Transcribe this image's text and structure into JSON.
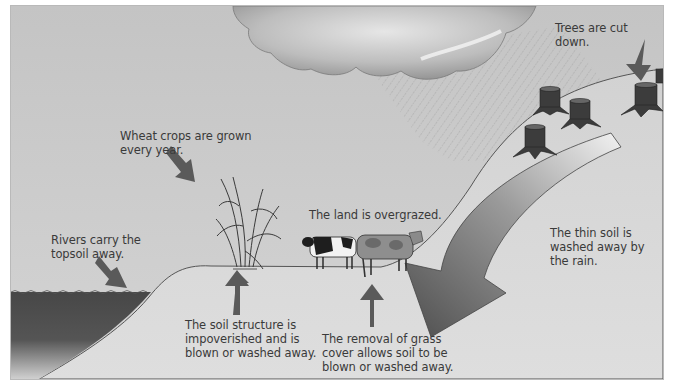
{
  "diagram": {
    "topic": "Soil erosion",
    "colors": {
      "sky": "#c9c9c9",
      "ground": "#d6d6d6",
      "water": "#4a4a4a",
      "arrow": "#5c5c5c",
      "text": "#3a3a3a",
      "outline": "#555555"
    },
    "labels": {
      "wheat": "Wheat crops are grown\nevery year.",
      "rivers": "Rivers carry the\ntopsoil away.",
      "overgrazed": "The land is overgrazed.",
      "trees": "Trees are cut down.",
      "thin_soil": "The thin soil is\nwashed away by\nthe rain.",
      "soil_structure": "The soil structure is\nimpoverished and is\nblown or washed away.",
      "grass_cover": "The removal of grass\ncover allows soil to be\nblown or washed away."
    },
    "elements": {
      "cloud": "rain-cloud-icon",
      "rain": "rain-streaks",
      "wheat": "wheat-plant-icon",
      "cows": [
        "cow-holstein-icon",
        "cow-brown-icon"
      ],
      "stumps": [
        "tree-stump-icon",
        "tree-stump-icon",
        "tree-stump-icon",
        "tree-stump-icon",
        "tree-stump-icon"
      ],
      "river": "river-water",
      "big_arrow": "curved-erosion-arrow"
    }
  }
}
